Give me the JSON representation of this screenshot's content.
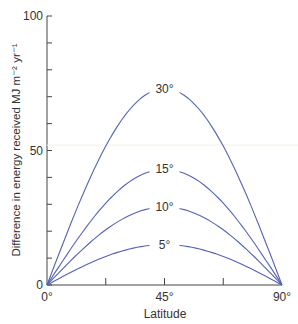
{
  "chart_data": {
    "type": "line",
    "title": "",
    "xlabel": "Latitude",
    "ylabel": "Difference in energy received MJ m⁻² yr⁻¹",
    "x_ticks": [
      "0°",
      "45°",
      "90°"
    ],
    "y_ticks": [
      "0",
      "50",
      "100"
    ],
    "xlim": [
      0,
      90
    ],
    "ylim": [
      0,
      100
    ],
    "grid": false,
    "series": [
      {
        "name": "30°",
        "x": [
          0,
          45,
          90
        ],
        "peak": 73,
        "values": [
          0,
          73,
          0
        ]
      },
      {
        "name": "15°",
        "x": [
          0,
          45,
          90
        ],
        "peak": 43,
        "values": [
          0,
          43,
          0
        ]
      },
      {
        "name": "10°",
        "x": [
          0,
          45,
          90
        ],
        "peak": 29,
        "values": [
          0,
          29,
          0
        ]
      },
      {
        "name": "5°",
        "x": [
          0,
          45,
          90
        ],
        "peak": 15,
        "values": [
          0,
          15,
          0
        ]
      }
    ],
    "line_color": "#5563b5"
  }
}
